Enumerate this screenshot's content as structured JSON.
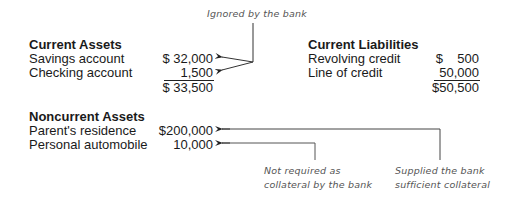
{
  "annotations": {
    "top": "Ignored by the bank",
    "bottom_left": [
      "Not required as",
      "collateral by the bank"
    ],
    "bottom_right": [
      "Supplied the bank",
      "sufficient collateral"
    ]
  },
  "current_assets": {
    "title": "Current Assets",
    "rows": [
      {
        "label": "Savings account",
        "value": "$ 32,000"
      },
      {
        "label": "Checking account",
        "value": "1,500"
      }
    ],
    "total": "$ 33,500"
  },
  "current_liabilities": {
    "title": "Current Liabilities",
    "rows": [
      {
        "label": "Revolving credit",
        "value": "$    500"
      },
      {
        "label": "Line of credit",
        "value": "50,000"
      }
    ],
    "total": "$50,500"
  },
  "noncurrent_assets": {
    "title": "Noncurrent Assets",
    "rows": [
      {
        "label": "Parent's residence",
        "value": "$200,000"
      },
      {
        "label": "Personal automobile",
        "value": "10,000"
      }
    ]
  }
}
